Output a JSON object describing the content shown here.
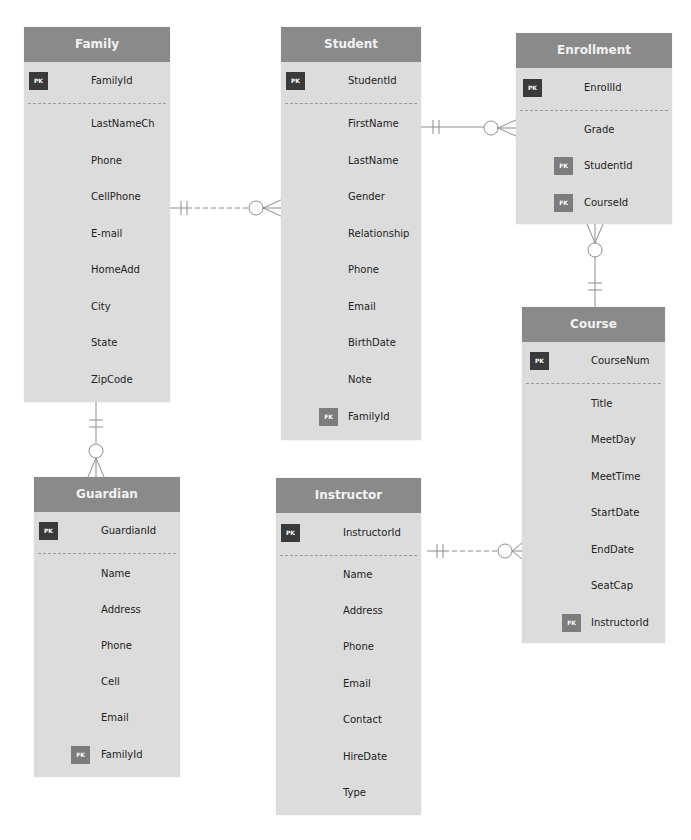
{
  "diagram": {
    "type": "entity-relationship",
    "notation": "crow's foot",
    "colors": {
      "header": "#8a8a8a",
      "body": "#dcdcdc",
      "pk_badge": "#3a3a3a",
      "fk_badge": "#7c7c7c",
      "line": "#8c8c8c"
    },
    "entities": {
      "family": {
        "title": "Family",
        "pk": {
          "badge": "PK",
          "name": "FamilyId"
        },
        "attributes": [
          "LastNameCh",
          "Phone",
          "CellPhone",
          "E-mail",
          "HomeAdd",
          "City",
          "State",
          "ZipCode"
        ]
      },
      "student": {
        "title": "Student",
        "pk": {
          "badge": "PK",
          "name": "StudentId"
        },
        "attributes": [
          "FirstName",
          "LastName",
          "Gender",
          "Relationship",
          "Phone",
          "Email",
          "BirthDate",
          "Note"
        ],
        "fk": [
          {
            "badge": "FK",
            "name": "FamilyId"
          }
        ]
      },
      "enrollment": {
        "title": "Enrollment",
        "pk": {
          "badge": "PK",
          "name": "EnrollId"
        },
        "attributes": [
          "Grade"
        ],
        "fk": [
          {
            "badge": "FK",
            "name": "StudentId"
          },
          {
            "badge": "FK",
            "name": "CourseId"
          }
        ]
      },
      "course": {
        "title": "Course",
        "pk": {
          "badge": "PK",
          "name": "CourseNum"
        },
        "attributes": [
          "Title",
          "MeetDay",
          "MeetTime",
          "StartDate",
          "EndDate",
          "SeatCap"
        ],
        "fk": [
          {
            "badge": "FK",
            "name": "InstructorId"
          }
        ]
      },
      "guardian": {
        "title": "Guardian",
        "pk": {
          "badge": "PK",
          "name": "GuardianId"
        },
        "attributes": [
          "Name",
          "Address",
          "Phone",
          "Cell",
          "Email"
        ],
        "fk": [
          {
            "badge": "FK",
            "name": "FamilyId"
          }
        ]
      },
      "instructor": {
        "title": "Instructor",
        "pk": {
          "badge": "PK",
          "name": "InstructorId"
        },
        "attributes": [
          "Name",
          "Address",
          "Phone",
          "Email",
          "Contact",
          "HireDate",
          "Type"
        ]
      }
    },
    "relationships": [
      {
        "from": "Family",
        "to": "Student",
        "from_card": "one and only one",
        "to_card": "zero or many"
      },
      {
        "from": "Family",
        "to": "Guardian",
        "from_card": "one and only one",
        "to_card": "zero or many"
      },
      {
        "from": "Student",
        "to": "Enrollment",
        "from_card": "one and only one",
        "to_card": "zero or many"
      },
      {
        "from": "Course",
        "to": "Enrollment",
        "from_card": "one and only one",
        "to_card": "zero or many"
      },
      {
        "from": "Instructor",
        "to": "Course",
        "from_card": "one and only one",
        "to_card": "zero or many"
      }
    ]
  }
}
